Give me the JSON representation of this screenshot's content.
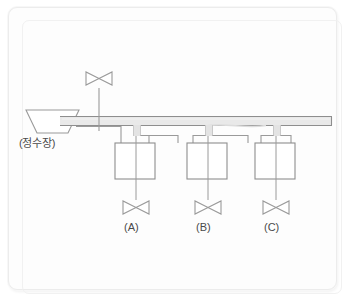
{
  "diagram": {
    "type": "piping-schematic",
    "source_label": "(정수장)",
    "valve_labels": [
      "(A)",
      "(B)",
      "(C)"
    ],
    "icons": {
      "butterfly_valve": "butterfly-valve-icon",
      "reservoir": "reservoir-trapezoid-icon",
      "meter_box": "meter-box-icon",
      "main_pipe": "main-pipe-icon",
      "branch_tee": "branch-tee-icon",
      "air_valve_riser": "air-valve-riser-icon"
    },
    "colors": {
      "background": "#fdfdfd",
      "pipe_fill": "#e6e6e6",
      "pipe_stroke": "#8c8c8c",
      "line": "#9a9a9a",
      "text": "#4a4a4a",
      "frame": "#ececec"
    },
    "geometry": {
      "main_pipe": {
        "x1": 60,
        "x2": 332,
        "y_top": 116,
        "y_bottom": 126
      },
      "riser_valve_x": 99,
      "riser_valve_y": 78,
      "branches": [
        {
          "label": "(A)",
          "tee_x": 137,
          "box_left": 115,
          "box_top": 143,
          "box_width": 40,
          "box_height": 36,
          "valve_y": 208,
          "label_y": 222
        },
        {
          "label": "(B)",
          "tee_x": 209,
          "box_left": 187,
          "box_top": 143,
          "box_width": 40,
          "box_height": 36,
          "valve_y": 208,
          "label_y": 222
        },
        {
          "label": "(C)",
          "tee_x": 277,
          "box_left": 255,
          "box_top": 143,
          "box_width": 40,
          "box_height": 36,
          "valve_y": 208,
          "label_y": 222
        }
      ],
      "reservoir": {
        "x_left": 25,
        "x_right": 78,
        "y_top": 110,
        "y_bottom": 133
      }
    }
  }
}
